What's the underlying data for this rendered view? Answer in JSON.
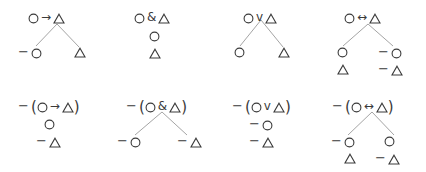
{
  "diagram": {
    "background_color": "#ffffff",
    "ink_color": "#3a3a3a",
    "line_color": "#9a9a9a",
    "atoms": {
      "circle": "O",
      "triangle": "Δ"
    },
    "symbols": {
      "negation": "−",
      "conditional": "→",
      "conjunction": "&",
      "disjunction": "v",
      "biconditional": "↔",
      "paren_open": "(",
      "paren_close": ")"
    },
    "rules": [
      {
        "id": "conditional",
        "row": 0,
        "col": 0,
        "root_label": "O → Δ",
        "root_parts": [
          "O",
          "→",
          "Δ"
        ],
        "branching": true,
        "branches": [
          {
            "side": "left",
            "nodes": [
              "−O"
            ]
          },
          {
            "side": "right",
            "nodes": [
              "Δ"
            ]
          }
        ]
      },
      {
        "id": "conjunction",
        "row": 0,
        "col": 1,
        "root_label": "O & Δ",
        "root_parts": [
          "O",
          "&",
          "Δ"
        ],
        "branching": false,
        "stack": [
          "O",
          "Δ"
        ]
      },
      {
        "id": "disjunction",
        "row": 0,
        "col": 2,
        "root_label": "O v Δ",
        "root_parts": [
          "O",
          "v",
          "Δ"
        ],
        "branching": true,
        "branches": [
          {
            "side": "left",
            "nodes": [
              "O"
            ]
          },
          {
            "side": "right",
            "nodes": [
              "Δ"
            ]
          }
        ]
      },
      {
        "id": "biconditional",
        "row": 0,
        "col": 3,
        "root_label": "O ↔ Δ",
        "root_parts": [
          "O",
          "↔",
          "Δ"
        ],
        "branching": true,
        "branches": [
          {
            "side": "left",
            "nodes": [
              "O",
              "Δ"
            ]
          },
          {
            "side": "right",
            "nodes": [
              "−O",
              "−Δ"
            ]
          }
        ]
      },
      {
        "id": "negated-conditional",
        "row": 1,
        "col": 0,
        "root_label": "−(O → Δ)",
        "root_parts": [
          "−",
          "(",
          "O",
          "→",
          "Δ",
          ")"
        ],
        "branching": false,
        "stack": [
          "O",
          "−Δ"
        ]
      },
      {
        "id": "negated-conjunction",
        "row": 1,
        "col": 1,
        "root_label": "−(O & Δ)",
        "root_parts": [
          "−",
          "(",
          "O",
          "&",
          "Δ",
          ")"
        ],
        "branching": true,
        "branches": [
          {
            "side": "left",
            "nodes": [
              "−O"
            ]
          },
          {
            "side": "right",
            "nodes": [
              "−Δ"
            ]
          }
        ]
      },
      {
        "id": "negated-disjunction",
        "row": 1,
        "col": 2,
        "root_label": "−(O v Δ)",
        "root_parts": [
          "−",
          "(",
          "O",
          "v",
          "Δ",
          ")"
        ],
        "branching": false,
        "stack": [
          "−O",
          "−Δ"
        ]
      },
      {
        "id": "negated-biconditional",
        "row": 1,
        "col": 3,
        "root_label": "−(O ↔ Δ)",
        "root_parts": [
          "−",
          "(",
          "O",
          "↔",
          "Δ",
          ")"
        ],
        "branching": true,
        "branches": [
          {
            "side": "left",
            "nodes": [
              "−O",
              "Δ"
            ]
          },
          {
            "side": "right",
            "nodes": [
              "O",
              "−Δ"
            ]
          }
        ]
      }
    ]
  }
}
